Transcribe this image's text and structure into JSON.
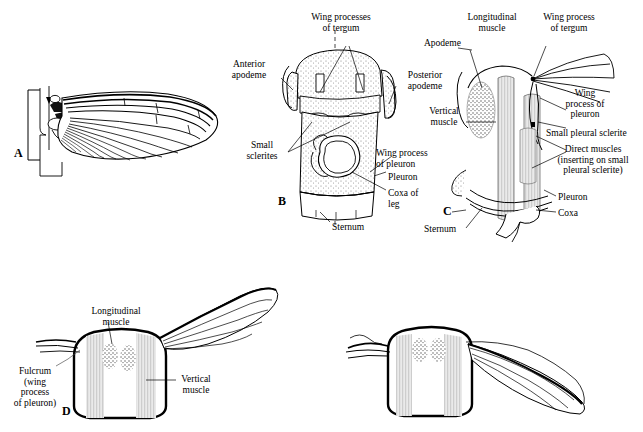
{
  "figure": {
    "background_color": "#ffffff",
    "ink_color": "#000000",
    "stipple_color": "#8a8a8a"
  },
  "panels": [
    {
      "id": "A",
      "plate_label": "A",
      "caption": "Wing and wing base in lateral view",
      "labels": []
    },
    {
      "id": "B",
      "plate_label": "B",
      "caption": "Thoracic segment showing tergum, pleuron and sternum",
      "labels": [
        {
          "key": "wing_processes_of_tergum",
          "text": "Wing processes\nof tergum"
        },
        {
          "key": "anterior_apodeme",
          "text": "Anterior\napodeme"
        },
        {
          "key": "posterior_apodeme",
          "text": "Posterior\napodeme"
        },
        {
          "key": "small_sclerites",
          "text": "Small\nsclerites"
        },
        {
          "key": "wing_process_of_pleuron",
          "text": "Wing process\nof pleuron"
        },
        {
          "key": "pleuron",
          "text": "Pleuron"
        },
        {
          "key": "coxa_of_leg",
          "text": "Coxa of\nleg"
        },
        {
          "key": "sternum",
          "text": "Sternum"
        }
      ]
    },
    {
      "id": "C",
      "plate_label": "C",
      "caption": "Thoracic segment with indirect and direct flight muscles",
      "labels": [
        {
          "key": "longitudinal_muscle",
          "text": "Longitudinal\nmuscle"
        },
        {
          "key": "apodeme",
          "text": "Apodeme"
        },
        {
          "key": "wing_process_of_tergum",
          "text": "Wing process\nof tergum"
        },
        {
          "key": "vertical_muscle",
          "text": "Vertical\nmuscle"
        },
        {
          "key": "wing_process_of_pleuron",
          "text": "Wing\nprocess of\npleuron"
        },
        {
          "key": "small_pleural_sclerite",
          "text": "Small pleural sclerite"
        },
        {
          "key": "direct_muscles",
          "text": "Direct muscles\n(inserting on small\npleural sclerite)"
        },
        {
          "key": "pleuron",
          "text": "Pleuron"
        },
        {
          "key": "coxa",
          "text": "Coxa"
        },
        {
          "key": "sternum",
          "text": "Sternum"
        }
      ]
    },
    {
      "id": "D",
      "plate_label": "D",
      "caption": "Cross-section of thorax with wing raised (upstroke)",
      "labels": [
        {
          "key": "longitudinal_muscle",
          "text": "Longitudinal\nmuscle"
        },
        {
          "key": "fulcrum",
          "text": "Fulcrum\n(wing\nprocess\nof pleuron)"
        },
        {
          "key": "vertical_muscle",
          "text": "Vertical\nmuscle"
        }
      ]
    },
    {
      "id": "E",
      "plate_label": "",
      "caption": "Cross-section of thorax with wing lowered (downstroke)",
      "labels": []
    }
  ]
}
